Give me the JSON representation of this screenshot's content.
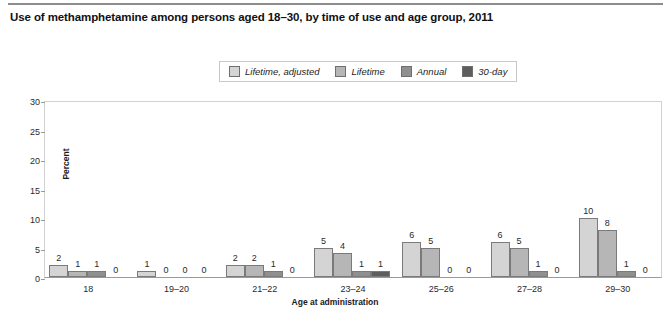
{
  "title": "Use of methamphetamine among persons aged 18–30, by time of use and age group, 2011",
  "axis": {
    "y_label": "Percent",
    "x_label": "Age at administration",
    "y_ticks": [
      "0",
      "5",
      "10",
      "15",
      "20",
      "25",
      "30"
    ]
  },
  "legend": {
    "items": [
      {
        "label": "Lifetime, adjusted",
        "color": "#d4d4d4"
      },
      {
        "label": "Lifetime",
        "color": "#b6b6b6"
      },
      {
        "label": "Annual",
        "color": "#8f8f8f"
      },
      {
        "label": "30-day",
        "color": "#5e5e5e"
      }
    ]
  },
  "chart_data": {
    "type": "bar",
    "title": "Use of methamphetamine among persons aged 18–30, by time of use and age group, 2011",
    "xlabel": "Age at administration",
    "ylabel": "Percent",
    "ylim": [
      0,
      30
    ],
    "ytick_step": 5,
    "grid": false,
    "legend_position": "top-center",
    "categories": [
      "18",
      "19–20",
      "21–22",
      "23–24",
      "25–26",
      "27–28",
      "29–30"
    ],
    "series": [
      {
        "name": "Lifetime, adjusted",
        "color": "#d4d4d4",
        "values": [
          2,
          1,
          2,
          5,
          6,
          6,
          10
        ]
      },
      {
        "name": "Lifetime",
        "color": "#b6b6b6",
        "values": [
          1,
          0,
          2,
          4,
          5,
          5,
          8
        ]
      },
      {
        "name": "Annual",
        "color": "#8f8f8f",
        "values": [
          1,
          0,
          1,
          1,
          0,
          1,
          1
        ]
      },
      {
        "name": "30-day",
        "color": "#5e5e5e",
        "values": [
          0,
          0,
          0,
          1,
          0,
          0,
          0
        ]
      }
    ]
  }
}
